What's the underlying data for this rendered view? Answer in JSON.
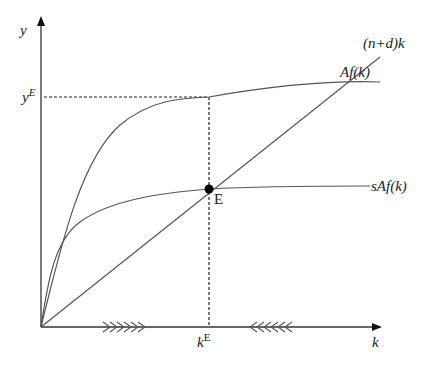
{
  "diagram": {
    "axes": {
      "y_label": "y",
      "x_label": "k"
    },
    "curves": [
      {
        "id": "production",
        "label": "Af(k)"
      },
      {
        "id": "savings",
        "label": "sAf(k)"
      },
      {
        "id": "break-even",
        "label": "(n+d)k"
      }
    ],
    "equilibrium": {
      "point_label": "E",
      "y_value_label_base": "y",
      "y_value_label_sup": "E",
      "k_value_label_base": "k",
      "k_value_label_sup": "E"
    },
    "arrows": {
      "left_of_equilibrium": "right-pointing chevrons (k increases)",
      "right_of_equilibrium": "left-pointing chevrons (k decreases)",
      "count_each": 6
    },
    "colors": {
      "line": "#555555",
      "axis": "#333333",
      "point": "#000000",
      "text": "#222222"
    }
  }
}
